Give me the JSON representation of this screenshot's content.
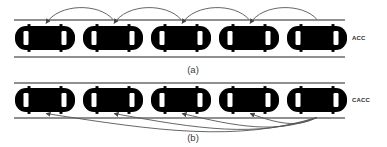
{
  "figure": {
    "title": "",
    "background_color": "#ffffff",
    "width": 387,
    "height": 147
  },
  "colors": {
    "car_body": "#000000",
    "car_window": "#ffffff",
    "lane_line": "#6b6b6b",
    "arc_line": "#555555",
    "label_text": "#3a3a3a",
    "scheme_text": "#2a2a2a"
  },
  "panels": [
    {
      "id": "panel-a",
      "caption": "(a)",
      "scheme_label": "ACC",
      "communication": "predecessor-following",
      "road": {
        "top_line_y": 20,
        "bottom_line_y": 57,
        "x_start": 14,
        "x_end": 345
      },
      "cars": [
        {
          "index": 1,
          "cx": 45,
          "cy": 38
        },
        {
          "index": 2,
          "cx": 113,
          "cy": 38
        },
        {
          "index": 3,
          "cx": 181,
          "cy": 38
        },
        {
          "index": 4,
          "cx": 249,
          "cy": 38
        },
        {
          "index": 5,
          "cx": 317,
          "cy": 38
        }
      ],
      "arcs": [
        {
          "from_car": 2,
          "to_car": 1,
          "x1": 113,
          "x2": 45,
          "arrow_at": "to"
        },
        {
          "from_car": 3,
          "to_car": 2,
          "x1": 181,
          "x2": 113,
          "arrow_at": "to"
        },
        {
          "from_car": 4,
          "to_car": 3,
          "x1": 249,
          "x2": 181,
          "arrow_at": "to"
        },
        {
          "from_car": 5,
          "to_car": 4,
          "x1": 317,
          "x2": 249,
          "arrow_at": "to"
        }
      ],
      "caption_x": 193,
      "caption_y": 70,
      "scheme_label_x": 352,
      "scheme_label_y": 38
    },
    {
      "id": "panel-b",
      "caption": "(b)",
      "scheme_label": "CACC",
      "communication": "all-predecessor-following",
      "road": {
        "top_line_y": 83,
        "bottom_line_y": 118,
        "x_start": 14,
        "x_end": 345
      },
      "cars": [
        {
          "index": 1,
          "cx": 45,
          "cy": 100
        },
        {
          "index": 2,
          "cx": 113,
          "cy": 100
        },
        {
          "index": 3,
          "cx": 181,
          "cy": 100
        },
        {
          "index": 4,
          "cx": 249,
          "cy": 100
        },
        {
          "index": 5,
          "cx": 317,
          "cy": 100
        }
      ],
      "arcs": [
        {
          "from_car": 5,
          "to_car": 4,
          "x1": 317,
          "x2": 249,
          "depth": 10,
          "arrow_at": "to"
        },
        {
          "from_car": 5,
          "to_car": 3,
          "x1": 317,
          "x2": 181,
          "depth": 16,
          "arrow_at": "to"
        },
        {
          "from_car": 5,
          "to_car": 2,
          "x1": 317,
          "x2": 113,
          "depth": 20,
          "arrow_at": "to"
        },
        {
          "from_car": 5,
          "to_car": 1,
          "x1": 317,
          "x2": 45,
          "depth": 24,
          "arrow_at": "to"
        }
      ],
      "caption_x": 193,
      "caption_y": 138,
      "scheme_label_x": 352,
      "scheme_label_y": 100
    }
  ],
  "car_geometry": {
    "body_width": 60,
    "body_height": 24,
    "corner_radius": 11,
    "front_window_offset": 19,
    "rear_window_offset": 19,
    "window_width": 5,
    "window_height": 14,
    "wheel_width": 3,
    "wheel_height": 2.5,
    "wheel_front_offset": 16,
    "wheel_rear_offset": 16
  }
}
